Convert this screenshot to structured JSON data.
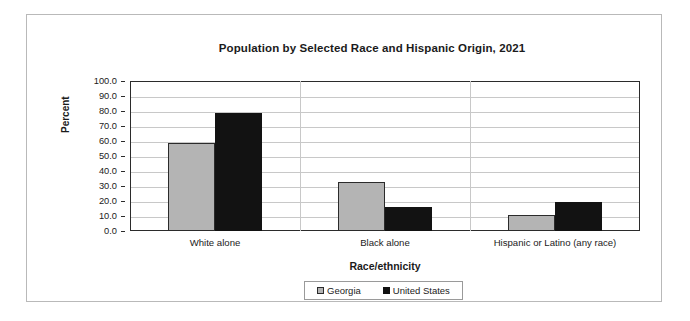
{
  "chart_data": {
    "type": "bar",
    "title": "Population by Selected Race and Hispanic Origin, 2021",
    "xlabel": "Race/ethnicity",
    "ylabel": "Percent",
    "categories": [
      "White alone",
      "Black alone",
      "Hispanic or Latino (any race)"
    ],
    "series": [
      {
        "name": "Georgia",
        "values": [
          59.0,
          32.7,
          10.7
        ],
        "color": "#b4b4b4"
      },
      {
        "name": "United States",
        "values": [
          78.7,
          16.2,
          19.3
        ],
        "color": "#121212"
      }
    ],
    "ylim": [
      0,
      100
    ],
    "yticks": [
      "0.0",
      "10.0",
      "20.0",
      "30.0",
      "40.0",
      "50.0",
      "60.0",
      "70.0",
      "80.0",
      "90.0",
      "100.0"
    ],
    "grid": true,
    "legend_position": "bottom"
  }
}
